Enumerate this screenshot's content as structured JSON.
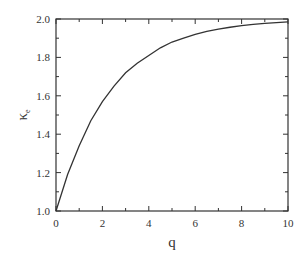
{
  "chart_data": {
    "type": "line",
    "title": "",
    "xlabel": "q",
    "ylabel": "κ",
    "ylabel_subscript": "e",
    "xlim": [
      0,
      10
    ],
    "ylim": [
      1.0,
      2.0
    ],
    "x_ticks": [
      0,
      2,
      4,
      6,
      8,
      10
    ],
    "x_tick_labels": [
      "0",
      "2",
      "4",
      "6",
      "8",
      "10"
    ],
    "x_minor_step": 1,
    "y_ticks": [
      1.0,
      1.2,
      1.4,
      1.6,
      1.8,
      2.0
    ],
    "y_tick_labels": [
      "1.0",
      "1.2",
      "1.4",
      "1.6",
      "1.8",
      "2.0"
    ],
    "y_minor_step": 0.1,
    "grid": false,
    "legend": null,
    "series": [
      {
        "name": "κ_e(q)",
        "color": "#333333",
        "x": [
          0,
          0.5,
          1,
          1.5,
          2,
          2.5,
          3,
          3.5,
          4,
          4.5,
          5,
          5.5,
          6,
          6.5,
          7,
          7.5,
          8,
          8.5,
          9,
          9.5,
          10
        ],
        "y": [
          1.0,
          1.19,
          1.34,
          1.47,
          1.57,
          1.65,
          1.72,
          1.77,
          1.81,
          1.85,
          1.88,
          1.9,
          1.92,
          1.935,
          1.947,
          1.957,
          1.965,
          1.972,
          1.977,
          1.981,
          1.985
        ]
      }
    ]
  },
  "colors": {
    "axis": "#333333",
    "line": "#333333",
    "background": "#ffffff"
  }
}
